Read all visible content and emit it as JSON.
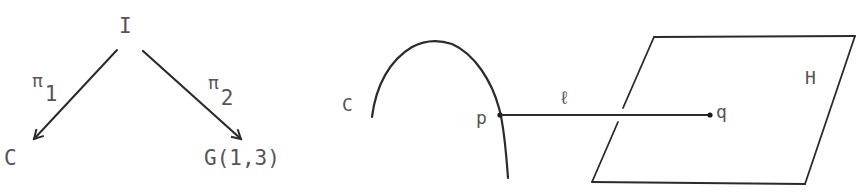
{
  "left_diagram": {
    "nodes": {
      "top": "I",
      "left": "C",
      "right": "G(1,3)"
    },
    "arrows": [
      {
        "from": "I",
        "to": "C",
        "label": "π",
        "subscript": "1"
      },
      {
        "from": "I",
        "to": "G(1,3)",
        "label": "π",
        "subscript": "2"
      }
    ]
  },
  "right_diagram": {
    "curve_label": "C",
    "point_on_curve": "p",
    "line_label": "ℓ",
    "point_on_plane": "q",
    "plane_label": "H"
  },
  "colors": {
    "ink": "#2b2b2b",
    "text": "#555555",
    "background": "#ffffff"
  }
}
